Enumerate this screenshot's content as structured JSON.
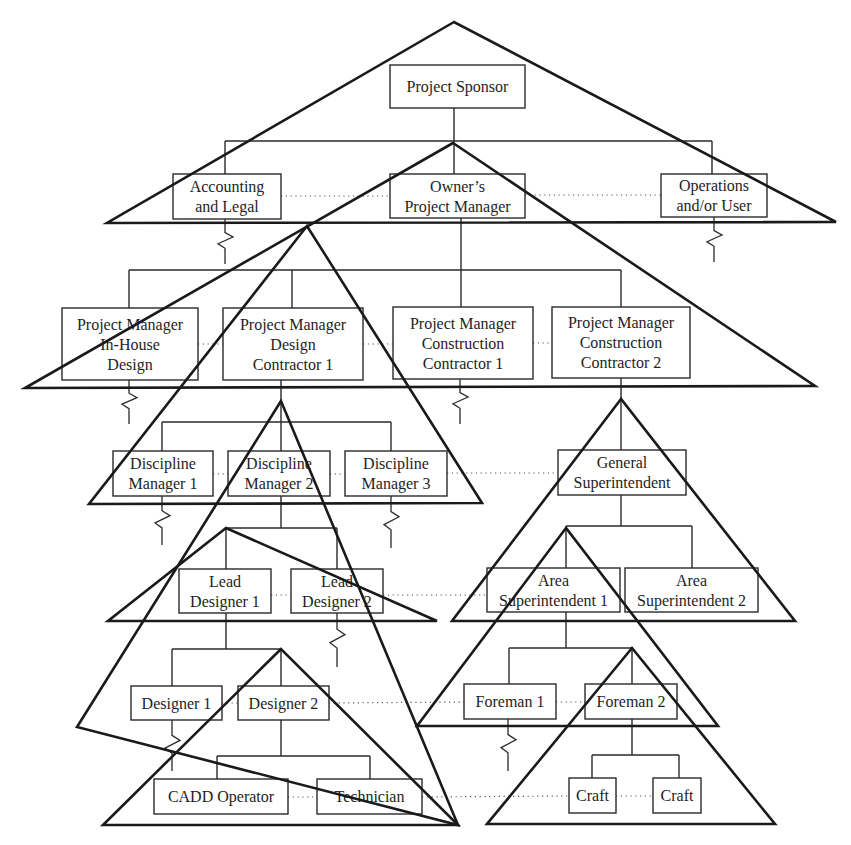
{
  "diagram": {
    "type": "org-chart-with-overlapping-team-triangles",
    "colors": {
      "line": "#2a2a2a",
      "triangle": "#1a1a1a",
      "text": "#1e1e1e",
      "background": "#ffffff"
    },
    "nodes": [
      {
        "id": "project-sponsor",
        "lines": [
          "Project Sponsor"
        ],
        "x": 390,
        "y": 65,
        "w": 135,
        "h": 43
      },
      {
        "id": "accounting-legal",
        "lines": [
          "Accounting",
          "and Legal"
        ],
        "x": 173,
        "y": 174,
        "w": 108,
        "h": 45
      },
      {
        "id": "owners-pm",
        "lines": [
          "Owner’s",
          "Project Manager"
        ],
        "x": 390,
        "y": 174,
        "w": 135,
        "h": 44
      },
      {
        "id": "operations-user",
        "lines": [
          "Operations",
          "and/or User"
        ],
        "x": 661,
        "y": 174,
        "w": 106,
        "h": 43
      },
      {
        "id": "pm-inhouse-design",
        "lines": [
          "Project Manager",
          "In-House",
          "Design"
        ],
        "x": 62,
        "y": 308,
        "w": 136,
        "h": 72
      },
      {
        "id": "pm-design-contractor-1",
        "lines": [
          "Project Manager",
          "Design",
          "Contractor 1"
        ],
        "x": 223,
        "y": 308,
        "w": 140,
        "h": 72
      },
      {
        "id": "pm-construction-contractor-1",
        "lines": [
          "Project Manager",
          "Construction",
          "Contractor 1"
        ],
        "x": 393,
        "y": 307,
        "w": 140,
        "h": 72
      },
      {
        "id": "pm-construction-contractor-2",
        "lines": [
          "Project Manager",
          "Construction",
          "Contractor 2"
        ],
        "x": 552,
        "y": 307,
        "w": 138,
        "h": 71
      },
      {
        "id": "discipline-manager-1",
        "lines": [
          "Discipline",
          "Manager 1"
        ],
        "x": 113,
        "y": 451,
        "w": 100,
        "h": 45
      },
      {
        "id": "discipline-manager-2",
        "lines": [
          "Discipline",
          "Manager 2"
        ],
        "x": 228,
        "y": 451,
        "w": 102,
        "h": 45
      },
      {
        "id": "discipline-manager-3",
        "lines": [
          "Discipline",
          "Manager 3"
        ],
        "x": 345,
        "y": 451,
        "w": 102,
        "h": 45
      },
      {
        "id": "general-superintendent",
        "lines": [
          "General",
          "Superintendent"
        ],
        "x": 558,
        "y": 450,
        "w": 128,
        "h": 45
      },
      {
        "id": "lead-designer-1",
        "lines": [
          "Lead",
          "Designer 1"
        ],
        "x": 179,
        "y": 569,
        "w": 92,
        "h": 44
      },
      {
        "id": "lead-designer-2",
        "lines": [
          "Lead",
          "Designer 2"
        ],
        "x": 291,
        "y": 569,
        "w": 92,
        "h": 44
      },
      {
        "id": "area-superintendent-1",
        "lines": [
          "Area",
          "Superintendent 1"
        ],
        "x": 487,
        "y": 568,
        "w": 133,
        "h": 44
      },
      {
        "id": "area-superintendent-2",
        "lines": [
          "Area",
          "Superintendent 2"
        ],
        "x": 625,
        "y": 568,
        "w": 133,
        "h": 44
      },
      {
        "id": "designer-1",
        "lines": [
          "Designer 1"
        ],
        "x": 131,
        "y": 686,
        "w": 91,
        "h": 34
      },
      {
        "id": "designer-2",
        "lines": [
          "Designer 2"
        ],
        "x": 238,
        "y": 686,
        "w": 91,
        "h": 34
      },
      {
        "id": "foreman-1",
        "lines": [
          "Foreman 1"
        ],
        "x": 464,
        "y": 684,
        "w": 92,
        "h": 35
      },
      {
        "id": "foreman-2",
        "lines": [
          "Foreman 2"
        ],
        "x": 585,
        "y": 684,
        "w": 92,
        "h": 35
      },
      {
        "id": "cadd-operator",
        "lines": [
          "CADD Operator"
        ],
        "x": 154,
        "y": 779,
        "w": 134,
        "h": 35
      },
      {
        "id": "technician",
        "lines": [
          "Technician"
        ],
        "x": 317,
        "y": 779,
        "w": 105,
        "h": 35
      },
      {
        "id": "craft-1",
        "lines": [
          "Craft"
        ],
        "x": 569,
        "y": 778,
        "w": 47,
        "h": 35
      },
      {
        "id": "craft-2",
        "lines": [
          "Craft"
        ],
        "x": 653,
        "y": 778,
        "w": 48,
        "h": 35
      }
    ],
    "connectors": [
      {
        "from": "project-sponsor",
        "stem": [
          454,
          108,
          454,
          141
        ],
        "bar": [
          225,
          141,
          712,
          141
        ],
        "drops": [
          [
            225,
            174
          ],
          [
            454,
            174
          ],
          [
            712,
            174
          ]
        ]
      },
      {
        "from": "owners-pm",
        "stem": [
          461,
          218,
          461,
          270
        ],
        "bar": [
          129,
          270,
          621,
          270
        ],
        "drops": [
          [
            129,
            308
          ],
          [
            292,
            308
          ],
          [
            461,
            307
          ],
          [
            621,
            307
          ]
        ]
      },
      {
        "from": "pm-design-contractor-1",
        "stem": [
          281,
          380,
          281,
          422
        ],
        "bar": [
          162,
          422,
          391,
          422
        ],
        "drops": [
          [
            162,
            451
          ],
          [
            281,
            451
          ],
          [
            391,
            451
          ]
        ]
      },
      {
        "from": "pm-construction-contractor-2",
        "stem": [
          621,
          378,
          621,
          450
        ],
        "bar": null,
        "drops": []
      },
      {
        "from": "discipline-manager-2",
        "stem": [
          281,
          496,
          281,
          528
        ],
        "bar": [
          226,
          528,
          337,
          528
        ],
        "drops": [
          [
            226,
            569
          ],
          [
            337,
            569
          ]
        ]
      },
      {
        "from": "general-superintendent",
        "stem": [
          621,
          495,
          621,
          526
        ],
        "bar": [
          566,
          526,
          692,
          526
        ],
        "drops": [
          [
            566,
            568
          ],
          [
            692,
            568
          ]
        ]
      },
      {
        "from": "lead-designer-1",
        "stem": [
          226,
          613,
          226,
          649
        ],
        "bar": [
          172,
          649,
          281,
          649
        ],
        "drops": [
          [
            172,
            686
          ],
          [
            281,
            686
          ]
        ]
      },
      {
        "from": "area-superintendent-1",
        "stem": [
          566,
          612,
          566,
          648
        ],
        "bar": [
          509,
          648,
          632,
          648
        ],
        "drops": [
          [
            509,
            684
          ],
          [
            632,
            684
          ]
        ]
      },
      {
        "from": "designer-2",
        "stem": [
          281,
          720,
          281,
          756
        ],
        "bar": [
          217,
          756,
          370,
          756
        ],
        "drops": [
          [
            217,
            779
          ],
          [
            370,
            779
          ]
        ]
      },
      {
        "from": "foreman-2",
        "stem": [
          632,
          719,
          632,
          755
        ],
        "bar": [
          592,
          755,
          679,
          755
        ],
        "drops": [
          [
            592,
            778
          ],
          [
            679,
            778
          ]
        ]
      }
    ],
    "dotted_links": [
      [
        281,
        196,
        390,
        196
      ],
      [
        525,
        195,
        661,
        195
      ],
      [
        198,
        344,
        223,
        344
      ],
      [
        363,
        344,
        393,
        344
      ],
      [
        533,
        343,
        552,
        343
      ],
      [
        213,
        474,
        228,
        474
      ],
      [
        330,
        474,
        345,
        474
      ],
      [
        447,
        473,
        558,
        473
      ],
      [
        271,
        595,
        291,
        595
      ],
      [
        383,
        595,
        487,
        595
      ],
      [
        222,
        703,
        238,
        703
      ],
      [
        329,
        703,
        464,
        702
      ],
      [
        556,
        702,
        585,
        702
      ],
      [
        288,
        797,
        317,
        797
      ],
      [
        422,
        797,
        569,
        796
      ],
      [
        616,
        796,
        653,
        796
      ]
    ],
    "zigzags": [
      {
        "x": 225,
        "y1": 219,
        "y2": 264
      },
      {
        "x": 714,
        "y1": 217,
        "y2": 262
      },
      {
        "x": 129,
        "y1": 380,
        "y2": 424
      },
      {
        "x": 460,
        "y1": 379,
        "y2": 424
      },
      {
        "x": 162,
        "y1": 496,
        "y2": 545
      },
      {
        "x": 391,
        "y1": 496,
        "y2": 548
      },
      {
        "x": 337,
        "y1": 613,
        "y2": 667
      },
      {
        "x": 172,
        "y1": 720,
        "y2": 771
      },
      {
        "x": 508,
        "y1": 719,
        "y2": 771
      }
    ],
    "triangles": [
      {
        "name": "sponsor-team",
        "apex": [
          454,
          22
        ],
        "left": [
          107,
          223
        ],
        "right": [
          836,
          222
        ]
      },
      {
        "name": "owner-team",
        "apex": [
          453,
          143
        ],
        "left": [
          25,
          388
        ],
        "right": [
          815,
          386
        ]
      },
      {
        "name": "design-contractor-team",
        "apex": [
          307,
          226
        ],
        "left": [
          89,
          504
        ],
        "right": [
          482,
          503
        ]
      },
      {
        "name": "discipline-team",
        "apex": [
          281,
          401
        ],
        "left": [
          77,
          727
        ],
        "right": [
          458,
          825
        ]
      },
      {
        "name": "lead-designer-team",
        "apex": [
          226,
          528
        ],
        "left": [
          108,
          621
        ],
        "right": [
          437,
          621
        ]
      },
      {
        "name": "designer-team",
        "apex": [
          281,
          649
        ],
        "left": [
          103,
          825
        ],
        "right": [
          458,
          825
        ]
      },
      {
        "name": "construction-contractor-team",
        "apex": [
          621,
          399
        ],
        "left": [
          452,
          621
        ],
        "right": [
          795,
          621
        ]
      },
      {
        "name": "area-superintendent-team",
        "apex": [
          566,
          528
        ],
        "left": [
          417,
          726
        ],
        "right": [
          718,
          726
        ]
      },
      {
        "name": "foreman-team",
        "apex": [
          632,
          648
        ],
        "left": [
          487,
          824
        ],
        "right": [
          775,
          824
        ]
      }
    ]
  }
}
